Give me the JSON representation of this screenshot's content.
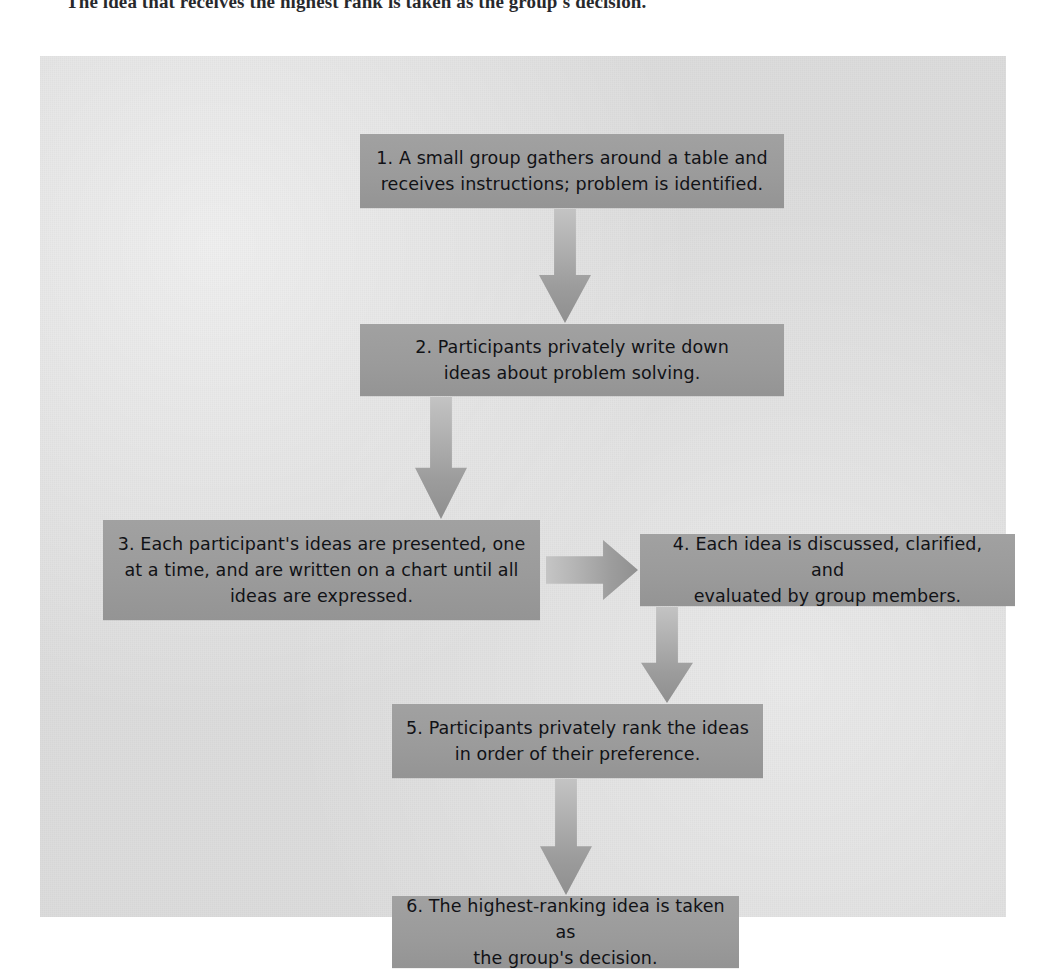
{
  "caption": {
    "text": "The idea that receives the highest rank is taken as the group's decision."
  },
  "figure": {
    "background_color": "#dcdcdc",
    "box_color": "#9a9a9a",
    "arrow_color": "#a9a9a9",
    "text_color": "#111216",
    "steps": [
      {
        "id": "step-1",
        "number": "1.",
        "lines": [
          "1. A small group gathers around a table and",
          "receives instructions; problem is identified."
        ],
        "text": "1. A small group gathers around a table and receives instructions; problem is identified."
      },
      {
        "id": "step-2",
        "number": "2.",
        "lines": [
          "2. Participants privately write down",
          "ideas about problem solving."
        ],
        "text": "2. Participants privately write down ideas about problem solving."
      },
      {
        "id": "step-3",
        "number": "3.",
        "lines": [
          "3. Each participant's ideas are presented, one",
          "at a time, and are written on a chart until all",
          "ideas are expressed."
        ],
        "text": "3. Each participant's ideas are presented, one at a time, and are written on a chart until all ideas are expressed."
      },
      {
        "id": "step-4",
        "number": "4.",
        "lines": [
          "4. Each idea is discussed, clarified, and",
          "evaluated by group members."
        ],
        "text": "4. Each idea is discussed, clarified, and evaluated by group members."
      },
      {
        "id": "step-5",
        "number": "5.",
        "lines": [
          "5. Participants privately rank the ideas",
          "in order of their preference."
        ],
        "text": "5. Participants privately rank the ideas in order of their preference."
      },
      {
        "id": "step-6",
        "number": "6.",
        "lines": [
          "6. The highest-ranking idea is taken as",
          "the group's decision."
        ],
        "text": "6. The highest-ranking idea is taken as the group's decision."
      }
    ],
    "connectors": [
      {
        "id": "arrow-1-2",
        "from": "step-1",
        "to": "step-2",
        "direction": "down"
      },
      {
        "id": "arrow-2-3",
        "from": "step-2",
        "to": "step-3",
        "direction": "down"
      },
      {
        "id": "arrow-3-4",
        "from": "step-3",
        "to": "step-4",
        "direction": "right"
      },
      {
        "id": "arrow-4-5",
        "from": "step-4",
        "to": "step-5",
        "direction": "down"
      },
      {
        "id": "arrow-5-6",
        "from": "step-5",
        "to": "step-6",
        "direction": "down"
      }
    ]
  }
}
